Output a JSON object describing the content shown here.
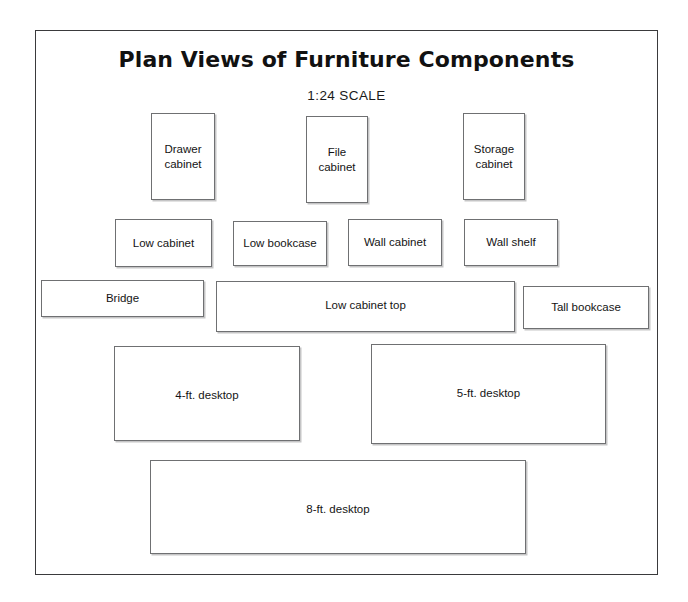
{
  "page": {
    "title": "Plan Views of Furniture Components",
    "subtitle": "1:24 SCALE",
    "background_color": "#ffffff",
    "frame_color": "#3a3a3c",
    "box_border_color": "#6f7072",
    "text_color": "#141414"
  },
  "rows": [
    {
      "name": "cabinets-row",
      "parts": [
        {
          "label": "Drawer\ncabinet",
          "x": 150,
          "y": 112,
          "w": 64,
          "h": 87
        },
        {
          "label": "File\ncabinet",
          "x": 305,
          "y": 115,
          "w": 62,
          "h": 87
        },
        {
          "label": "Storage\ncabinet",
          "x": 462,
          "y": 112,
          "w": 62,
          "h": 87
        }
      ]
    },
    {
      "name": "low-and-wall-units-row",
      "parts": [
        {
          "label": "Low cabinet",
          "x": 114,
          "y": 218,
          "w": 97,
          "h": 48
        },
        {
          "label": "Low bookcase",
          "x": 232,
          "y": 220,
          "w": 94,
          "h": 45
        },
        {
          "label": "Wall cabinet",
          "x": 347,
          "y": 218,
          "w": 94,
          "h": 47
        },
        {
          "label": "Wall shelf",
          "x": 463,
          "y": 218,
          "w": 94,
          "h": 47
        }
      ]
    },
    {
      "name": "tops-row",
      "parts": [
        {
          "label": "Bridge",
          "x": 40,
          "y": 279,
          "w": 163,
          "h": 37
        },
        {
          "label": "Low cabinet top",
          "x": 215,
          "y": 280,
          "w": 299,
          "h": 51
        },
        {
          "label": "Tall bookcase",
          "x": 522,
          "y": 285,
          "w": 126,
          "h": 43
        }
      ]
    },
    {
      "name": "desktops-row",
      "parts": [
        {
          "label": "4-ft. desktop",
          "x": 113,
          "y": 345,
          "w": 186,
          "h": 95
        },
        {
          "label": "5-ft. desktop",
          "x": 370,
          "y": 343,
          "w": 235,
          "h": 100
        }
      ]
    },
    {
      "name": "long-desktop-row",
      "parts": [
        {
          "label": "8-ft. desktop",
          "x": 149,
          "y": 459,
          "w": 376,
          "h": 94
        }
      ]
    }
  ]
}
